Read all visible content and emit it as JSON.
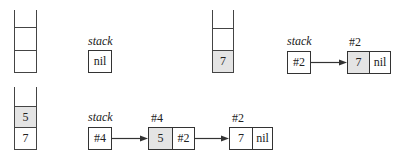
{
  "colors": {
    "stroke": "#333333",
    "shaded_fill": "#e4e4e4",
    "background": "#ffffff"
  },
  "panels": [
    {
      "id": "empty",
      "stack_slots": [
        "",
        "",
        ""
      ],
      "stack_label": "stack",
      "stack_pointer": "nil",
      "nodes": []
    },
    {
      "id": "push7",
      "stack_slots": [
        "",
        "",
        "7"
      ],
      "stack_label": "stack",
      "stack_pointer": "#2",
      "nodes": [
        {
          "address": "#2",
          "value": "7",
          "next": "nil",
          "shaded": true
        }
      ]
    },
    {
      "id": "push5",
      "stack_slots": [
        "",
        "5",
        "7"
      ],
      "stack_label": "stack",
      "stack_pointer": "#4",
      "nodes": [
        {
          "address": "#4",
          "value": "5",
          "next": "#2",
          "shaded": true
        },
        {
          "address": "#2",
          "value": "7",
          "next": "nil",
          "shaded": false
        }
      ]
    }
  ]
}
